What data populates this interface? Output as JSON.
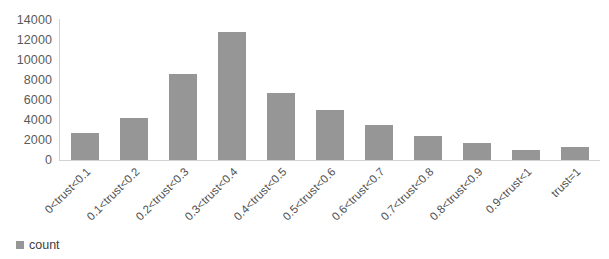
{
  "chart_data": {
    "type": "bar",
    "title": "",
    "xlabel": "",
    "ylabel": "",
    "ylim": [
      0,
      14000
    ],
    "ytick_step": 2000,
    "grid": false,
    "legend_position": "bottom-left",
    "bar_color": "#969696",
    "axis_color": "#d2d2d2",
    "text_color": "#5a5a5a",
    "categories": [
      "0<trust<0.1",
      "0.1<trust<0.2",
      "0.2<trust<0.3",
      "0.3<trust<0.4",
      "0.4<trust<0.5",
      "0.5<trust<0.6",
      "0.6<trust<0.7",
      "0.7<trust<0.8",
      "0.8<trust<0.9",
      "0.9<trust<1",
      "trust=1"
    ],
    "yticks": [
      "14000",
      "12000",
      "10000",
      "8000",
      "6000",
      "4000",
      "2000",
      "0"
    ],
    "series": [
      {
        "name": "count",
        "values": [
          2700,
          4200,
          8600,
          12800,
          6700,
          5000,
          3500,
          2400,
          1700,
          1000,
          1300
        ]
      }
    ]
  },
  "legend": {
    "items": [
      {
        "label": "count",
        "color": "#969696"
      }
    ]
  }
}
